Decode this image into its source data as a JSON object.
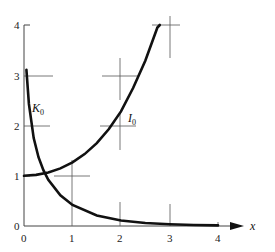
{
  "chart_data": {
    "type": "line",
    "title": "",
    "xlabel": "x",
    "ylabel": "",
    "xlim": [
      0,
      4
    ],
    "ylim": [
      0,
      4
    ],
    "x_ticks": [
      "0",
      "1",
      "2",
      "3",
      "4"
    ],
    "y_ticks": [
      "0",
      "1",
      "2",
      "3",
      "4"
    ],
    "grid": "partial crosshair marks",
    "legend": "inline curve labels",
    "series": [
      {
        "name": "I0",
        "label": "I",
        "subscript": "0",
        "x": [
          0,
          0.25,
          0.5,
          0.75,
          1.0,
          1.25,
          1.5,
          1.75,
          2.0,
          2.25,
          2.5,
          2.75,
          2.8
        ],
        "values": [
          1.0,
          1.016,
          1.063,
          1.146,
          1.266,
          1.43,
          1.647,
          1.93,
          2.28,
          2.747,
          3.29,
          3.95,
          4.0
        ]
      },
      {
        "name": "K0",
        "label": "K",
        "subscript": "0",
        "x": [
          0.05,
          0.1,
          0.2,
          0.3,
          0.4,
          0.5,
          0.75,
          1.0,
          1.5,
          2.0,
          2.5,
          3.0,
          3.5,
          4.0
        ],
        "values": [
          3.11,
          2.43,
          1.75,
          1.37,
          1.11,
          0.92,
          0.61,
          0.42,
          0.21,
          0.11,
          0.06,
          0.035,
          0.02,
          0.011
        ]
      }
    ]
  },
  "labels": {
    "x_axis": "x",
    "curve_k": "K",
    "curve_k_sub": "0",
    "curve_i": "I",
    "curve_i_sub": "0",
    "x0": "0",
    "x1": "1",
    "x2": "2",
    "x3": "3",
    "x4": "4",
    "y0": "0",
    "y1": "1",
    "y2": "2",
    "y3": "3",
    "y4": "4"
  }
}
